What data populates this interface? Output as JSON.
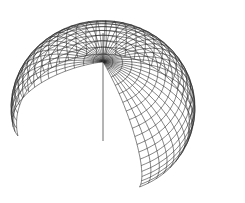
{
  "figure": {
    "type": "wireframe-partial-sphere",
    "canvas": {
      "width": 245,
      "height": 203,
      "background": "#ffffff"
    },
    "line_color": "#222222",
    "axis_color": "#444444",
    "mesh": {
      "theta_start_deg": 0,
      "theta_end_deg": 110,
      "theta_steps": 18,
      "phi_start_deg": -40,
      "phi_end_deg": 215,
      "phi_steps": 40
    },
    "projection": {
      "center_x": 103,
      "center_y": 108,
      "radius": 92,
      "tilt_deg": 58,
      "rotate_deg": -25
    },
    "axis": {
      "x": 103,
      "y_top": 33,
      "y_bottom": 141
    }
  }
}
